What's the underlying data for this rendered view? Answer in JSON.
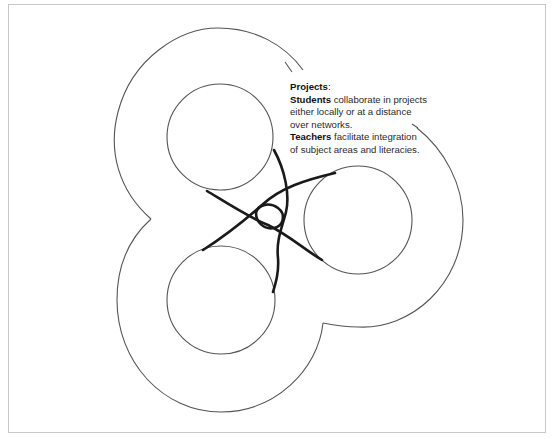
{
  "diagram": {
    "title": "Projects",
    "title_suffix": ":",
    "lines": [
      {
        "bold": "Students",
        "text": " collaborate in projects"
      },
      {
        "bold": "",
        "text": "either locally or at a distance"
      },
      {
        "bold": "",
        "text": "over networks."
      },
      {
        "bold": "Teachers",
        "text": " facilitate integration"
      },
      {
        "bold": "",
        "text": "of subject areas and literacies."
      }
    ],
    "colors": {
      "outline": "#555555",
      "knot": "#1a1a1a",
      "frame": "#c8c8c8",
      "text": "#2a2a2a"
    },
    "shapes": {
      "outer_trefoil": "three-lobed outer boundary",
      "inner_circles": 3,
      "central_knot": "interlaced strands connecting the three inner circles"
    }
  }
}
